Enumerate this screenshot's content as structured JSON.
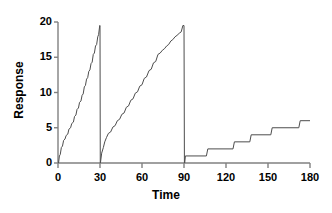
{
  "chart_data": {
    "type": "line",
    "title": "",
    "xlabel": "Time",
    "ylabel": "Response",
    "xlim": [
      0,
      180
    ],
    "ylim": [
      0,
      20
    ],
    "xticks": [
      0,
      30,
      60,
      90,
      120,
      150,
      180
    ],
    "yticks": [
      0,
      5,
      10,
      15,
      20
    ],
    "xtick_labels": [
      "0",
      "30",
      "60",
      "90",
      "120",
      "150",
      "180"
    ],
    "ytick_labels": [
      "0",
      "5",
      "10",
      "15",
      "20"
    ],
    "grid": false,
    "legend": false,
    "line_color": "#4d4d4d",
    "axis_color": "#808080",
    "series": [
      {
        "name": "segment-1",
        "comment": "Steep scalloped cumulative curve, 0 to 30, rising to 19.5 then resetting to 0",
        "points": [
          [
            0.4,
            0.0
          ],
          [
            1.0,
            1.0
          ],
          [
            1.6,
            1.2
          ],
          [
            2.4,
            2.2
          ],
          [
            3.2,
            2.4
          ],
          [
            4.0,
            3.2
          ],
          [
            5.0,
            3.4
          ],
          [
            5.8,
            3.9
          ],
          [
            7.0,
            4.1
          ],
          [
            7.8,
            4.8
          ],
          [
            9.0,
            5.0
          ],
          [
            9.8,
            5.6
          ],
          [
            11.0,
            5.8
          ],
          [
            11.8,
            6.6
          ],
          [
            12.8,
            6.8
          ],
          [
            13.6,
            7.6
          ],
          [
            14.6,
            7.8
          ],
          [
            15.4,
            8.6
          ],
          [
            16.4,
            8.8
          ],
          [
            17.2,
            9.6
          ],
          [
            18.0,
            9.8
          ],
          [
            18.8,
            10.8
          ],
          [
            19.6,
            11.0
          ],
          [
            20.4,
            11.9
          ],
          [
            21.2,
            12.1
          ],
          [
            22.0,
            13.0
          ],
          [
            22.8,
            13.2
          ],
          [
            23.6,
            14.1
          ],
          [
            24.4,
            14.3
          ],
          [
            25.2,
            15.4
          ],
          [
            26.0,
            15.6
          ],
          [
            26.8,
            16.6
          ],
          [
            27.6,
            16.8
          ],
          [
            28.4,
            17.9
          ],
          [
            29.0,
            18.2
          ],
          [
            29.8,
            19.5
          ],
          [
            30.0,
            19.5
          ],
          [
            30.2,
            0.0
          ]
        ]
      },
      {
        "name": "segment-2",
        "comment": "Staircase cumulative curve, 30 to 90, rising to 19.5 then resetting to 0",
        "points": [
          [
            30.3,
            0.0
          ],
          [
            31.2,
            1.4
          ],
          [
            32.4,
            2.2
          ],
          [
            33.4,
            3.0
          ],
          [
            34.6,
            3.6
          ],
          [
            36.0,
            4.2
          ],
          [
            37.6,
            4.4
          ],
          [
            39.2,
            5.1
          ],
          [
            40.8,
            5.3
          ],
          [
            42.4,
            6.0
          ],
          [
            44.0,
            6.2
          ],
          [
            45.6,
            6.9
          ],
          [
            47.2,
            7.1
          ],
          [
            48.8,
            7.9
          ],
          [
            50.4,
            8.1
          ],
          [
            52.0,
            8.9
          ],
          [
            53.6,
            9.1
          ],
          [
            55.2,
            9.9
          ],
          [
            56.8,
            10.1
          ],
          [
            58.4,
            10.9
          ],
          [
            60.0,
            11.1
          ],
          [
            61.6,
            12.0
          ],
          [
            63.2,
            12.2
          ],
          [
            65.0,
            13.1
          ],
          [
            66.6,
            13.3
          ],
          [
            68.2,
            14.2
          ],
          [
            69.8,
            14.4
          ],
          [
            71.4,
            15.4
          ],
          [
            73.0,
            15.6
          ],
          [
            74.6,
            16.0
          ],
          [
            76.0,
            16.2
          ],
          [
            77.6,
            16.6
          ],
          [
            79.0,
            16.8
          ],
          [
            80.6,
            17.3
          ],
          [
            82.0,
            17.5
          ],
          [
            83.6,
            17.9
          ],
          [
            85.0,
            18.1
          ],
          [
            86.6,
            18.4
          ],
          [
            88.0,
            18.6
          ],
          [
            89.2,
            19.5
          ],
          [
            90.0,
            19.5
          ],
          [
            90.3,
            0.0
          ]
        ]
      },
      {
        "name": "segment-3",
        "comment": "Low slow staircase, 90 to 180, reaching about 6",
        "points": [
          [
            90.5,
            0.0
          ],
          [
            91.0,
            1.0
          ],
          [
            106.0,
            1.0
          ],
          [
            107.0,
            2.0
          ],
          [
            125.0,
            2.0
          ],
          [
            126.0,
            3.0
          ],
          [
            137.0,
            3.0
          ],
          [
            138.0,
            4.0
          ],
          [
            152.0,
            4.0
          ],
          [
            153.0,
            5.0
          ],
          [
            172.0,
            5.0
          ],
          [
            173.0,
            6.0
          ],
          [
            180.0,
            6.0
          ]
        ]
      }
    ]
  },
  "axes": {
    "x_title": "Time",
    "y_title": "Response"
  }
}
